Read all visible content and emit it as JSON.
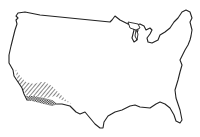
{
  "map": {
    "subject": "Contiguous United States outline",
    "highlighted_region": {
      "name": "Southwest (southern California, Arizona, southern Nevada)",
      "pattern": "diagonal hatching with dense cross-hatch near border"
    },
    "colors": {
      "outline": "#222222",
      "background": "#ffffff",
      "hatch": "#222222"
    }
  }
}
